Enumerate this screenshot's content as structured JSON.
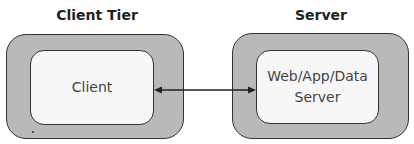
{
  "diagram": {
    "tiers": [
      {
        "title": "Client Tier",
        "node_label": "Client"
      },
      {
        "title": "Server",
        "node_label_lines": [
          "Web/App/Data",
          "Server"
        ]
      }
    ],
    "connector": {
      "type": "bidirectional-arrow",
      "from": "Client",
      "to": "Web/App/Data Server"
    },
    "colors": {
      "outer_fill": "#b9b9b9",
      "inner_fill": "#f7f7f7",
      "stroke": "#333333"
    }
  }
}
